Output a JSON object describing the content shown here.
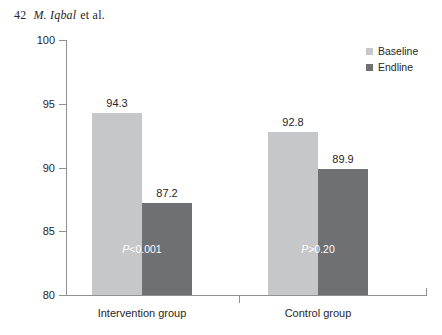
{
  "running_head": {
    "folio": "42",
    "author": "M. Iqbal",
    "suffix": "et al."
  },
  "legend": {
    "position": "top-right",
    "items": [
      {
        "label": "Baseline",
        "color": "#c5c7c9"
      },
      {
        "label": "Endline",
        "color": "#6e7073"
      }
    ]
  },
  "axis": {
    "y_title": "Percentage of prescriptions",
    "y_ticks": [
      "80",
      "85",
      "90",
      "95",
      "100"
    ]
  },
  "annotations": [
    {
      "group": "Intervention group",
      "prefix": "P",
      "rest": "<0.001"
    },
    {
      "group": "Control group",
      "prefix": "P",
      "rest": ">0.20"
    }
  ],
  "chart_data": {
    "type": "bar",
    "title": "",
    "xlabel": "",
    "ylabel": "Percentage of prescriptions",
    "ylim": [
      80,
      100
    ],
    "yticks": [
      80,
      85,
      90,
      95,
      100
    ],
    "grid": false,
    "legend_position": "top-right",
    "categories": [
      "Intervention group",
      "Control group"
    ],
    "series": [
      {
        "name": "Baseline",
        "color": "#c5c7c9",
        "values": [
          94.3,
          92.8
        ]
      },
      {
        "name": "Endline",
        "color": "#6e7073",
        "values": [
          87.2,
          89.9
        ]
      }
    ],
    "data_labels": [
      {
        "category": "Intervention group",
        "series": "Baseline",
        "value": "94.3"
      },
      {
        "category": "Intervention group",
        "series": "Endline",
        "value": "87.2"
      },
      {
        "category": "Control group",
        "series": "Baseline",
        "value": "92.8"
      },
      {
        "category": "Control group",
        "series": "Endline",
        "value": "89.9"
      }
    ],
    "annotations": [
      {
        "category": "Intervention group",
        "text": "P<0.001"
      },
      {
        "category": "Control group",
        "text": "P>0.20"
      }
    ]
  }
}
